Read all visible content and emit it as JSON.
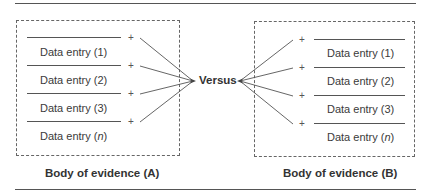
{
  "diagram": {
    "center_label": "Versus",
    "left_group": {
      "caption": "Body of evidence (A)",
      "entries": [
        {
          "prefix": "Data entry (",
          "index": "1",
          "suffix": ")",
          "italic": false
        },
        {
          "prefix": "Data entry (",
          "index": "2",
          "suffix": ")",
          "italic": false
        },
        {
          "prefix": "Data entry (",
          "index": "3",
          "suffix": ")",
          "italic": false
        },
        {
          "prefix": "Data entry (",
          "index": "n",
          "suffix": ")",
          "italic": true
        }
      ],
      "plus_symbol": "+"
    },
    "right_group": {
      "caption": "Body of evidence (B)",
      "entries": [
        {
          "prefix": "Data entry (",
          "index": "1",
          "suffix": ")",
          "italic": false
        },
        {
          "prefix": "Data entry (",
          "index": "2",
          "suffix": ")",
          "italic": false
        },
        {
          "prefix": "Data entry (",
          "index": "3",
          "suffix": ")",
          "italic": false
        },
        {
          "prefix": "Data entry (",
          "index": "n",
          "suffix": ")",
          "italic": true
        }
      ],
      "plus_symbol": "+"
    }
  }
}
